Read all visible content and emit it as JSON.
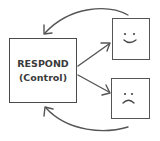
{
  "diagram": {
    "control_node": {
      "title": "RESPOND",
      "subtitle": "(Control)"
    },
    "outcomes": [
      {
        "id": "positive",
        "face": "smiling-face"
      },
      {
        "id": "negative",
        "face": "frowning-face"
      }
    ],
    "edges": [
      {
        "from": "control_node",
        "to": "positive",
        "style": "straight-arrow"
      },
      {
        "from": "control_node",
        "to": "negative",
        "style": "straight-arrow"
      },
      {
        "from": "positive",
        "to": "control_node",
        "style": "curved-feedback-arrow"
      },
      {
        "from": "negative",
        "to": "control_node",
        "style": "curved-feedback-arrow"
      }
    ],
    "colors": {
      "stroke": "#4a4a4a",
      "text": "#3a3a3a",
      "background": "#ffffff"
    }
  }
}
